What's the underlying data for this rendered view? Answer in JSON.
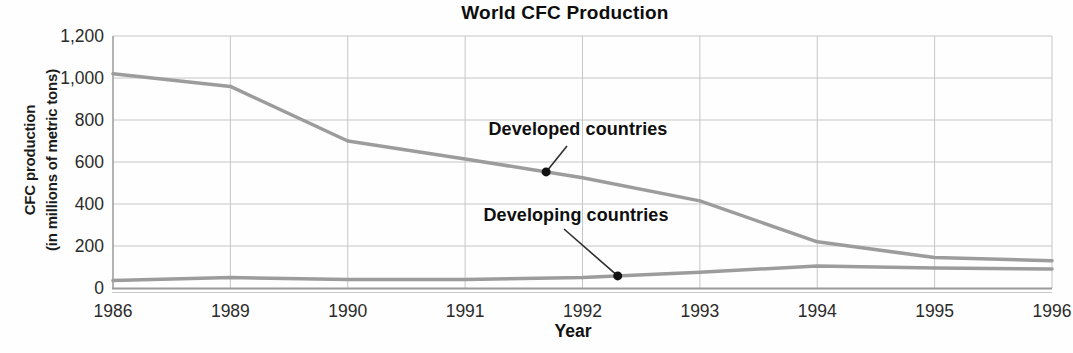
{
  "chart_data": {
    "type": "line",
    "title": "World CFC Production",
    "xlabel": "Year",
    "ylabel_lines": [
      "CFC production",
      "(in millions of metric tons)"
    ],
    "categories": [
      "1986",
      "1989",
      "1990",
      "1991",
      "1992",
      "1993",
      "1994",
      "1995",
      "1996"
    ],
    "yticks": [
      "0",
      "200",
      "400",
      "600",
      "800",
      "1,000",
      "1,200"
    ],
    "ylim": [
      0,
      1200
    ],
    "grid": true,
    "legend_position": "inline-annotations",
    "series": [
      {
        "name": "Developed countries",
        "values": [
          1020,
          960,
          700,
          615,
          525,
          415,
          220,
          145,
          130
        ]
      },
      {
        "name": "Developing countries",
        "values": [
          35,
          50,
          40,
          40,
          50,
          75,
          105,
          95,
          90
        ]
      }
    ],
    "annotations": [
      {
        "label": "Developed countries",
        "series": 0,
        "x": 3.69
      },
      {
        "label": "Developing countries",
        "series": 1,
        "x": 4.3
      }
    ],
    "colors": {
      "line": "#9c9c9c",
      "grid": "#c6c6c6",
      "axis": "#9a9a9a",
      "axis_shadow": "#c9c9c9",
      "tick_text": "#2b2b2b",
      "dot": "#111111",
      "leader": "#2e2e2e"
    }
  }
}
